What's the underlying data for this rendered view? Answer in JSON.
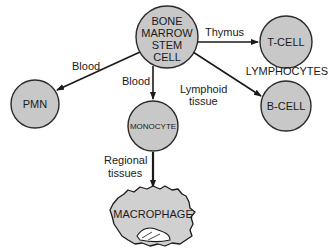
{
  "colors": {
    "cell_fill": "#c8c8c8",
    "cell_stroke": "#2a2a2a",
    "edge": "#1a1a1a",
    "text": "#1a1a1a"
  },
  "nodes": {
    "stem_cell": {
      "lines": [
        "BONE",
        "MARROW",
        "STEM",
        "CELL"
      ]
    },
    "t_cell": {
      "label": "T-CELL"
    },
    "b_cell": {
      "label": "B-CELL"
    },
    "pmn": {
      "label": "PMN"
    },
    "monocyte": {
      "label": "MONOCYTE"
    },
    "macrophage": {
      "label": "MACROPHAGE"
    }
  },
  "group_labels": {
    "lymphocytes": "LYMPHOCYTES"
  },
  "edges": {
    "stem_to_t": {
      "label": "Thymus"
    },
    "stem_to_b": {
      "lines": [
        "Lymphoid",
        "tissue"
      ]
    },
    "stem_to_pmn": {
      "label": "Blood"
    },
    "stem_to_monocyte": {
      "label": "Blood"
    },
    "monocyte_to_macrophage": {
      "lines": [
        "Regional",
        "tissues"
      ]
    }
  }
}
